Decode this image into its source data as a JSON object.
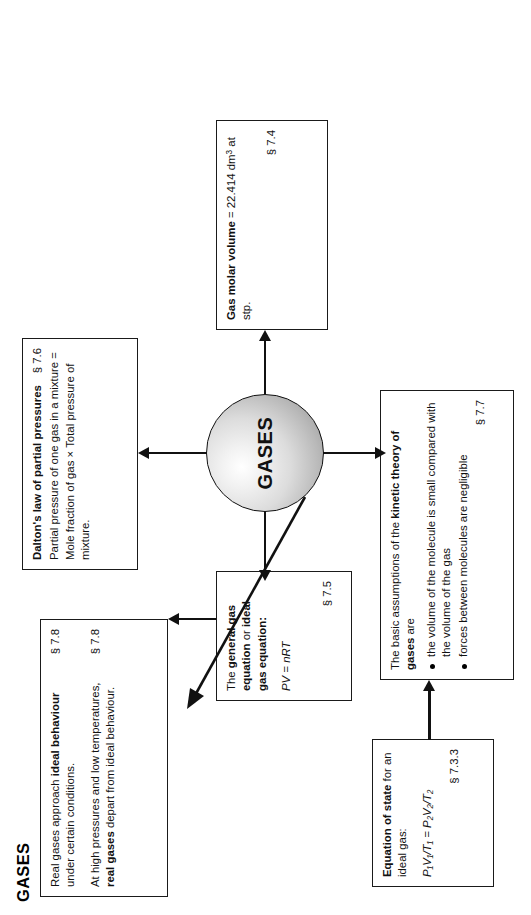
{
  "page": {
    "title": "GASES",
    "center_node": "GASES"
  },
  "nodes": {
    "real_gases": {
      "p1_pre": "Real gases approach ",
      "p1_bold": "ideal behaviour",
      "p1_post": " under certain conditions.",
      "p1_section": "§ 7.8",
      "p2_pre": "At high pressures and low temperatures, ",
      "p2_bold": "real gases",
      "p2_post": " depart from ideal behaviour.",
      "p2_section": "§ 7.8"
    },
    "dalton": {
      "heading": "Dalton's law of partial pressures",
      "body": "Partial pressure of one gas in a mixture = Mole fraction of gas × Total pressure of mixture.",
      "section": "§ 7.6"
    },
    "general_gas_equation": {
      "line1_pre": "The ",
      "line1_bold_a": "general gas equation",
      "line1_mid": " or ",
      "line1_bold_b": "ideal gas equation:",
      "formula": "PV = nRT",
      "section": "§ 7.5"
    },
    "molar_volume": {
      "bold": "Gas molar volume",
      "value": " = 22.414 dm",
      "value_sup": "3",
      "value_tail": " at stp.",
      "section": "§ 7.4"
    },
    "equation_of_state": {
      "heading_bold": "Equation of state",
      "heading_rest": " for an ideal gas:",
      "formula": "P₁V₁/T₁ = P₂V₂/T₂",
      "section": "§ 7.3.3"
    },
    "kinetic_theory": {
      "intro_pre": "The basic assumptions of the ",
      "intro_bold": "kinetic theory of gases",
      "intro_post": " are",
      "bullets": [
        "the volume of the molecule is small compared with the volume of the gas",
        "forces between molecules are negligible"
      ],
      "section": "§ 7.7"
    }
  },
  "colors": {
    "stroke": "#111111",
    "box_fill": "#ffffff",
    "sphere_light": "#ffffff",
    "sphere_dark": "#8f8f8f",
    "text": "#111111"
  }
}
